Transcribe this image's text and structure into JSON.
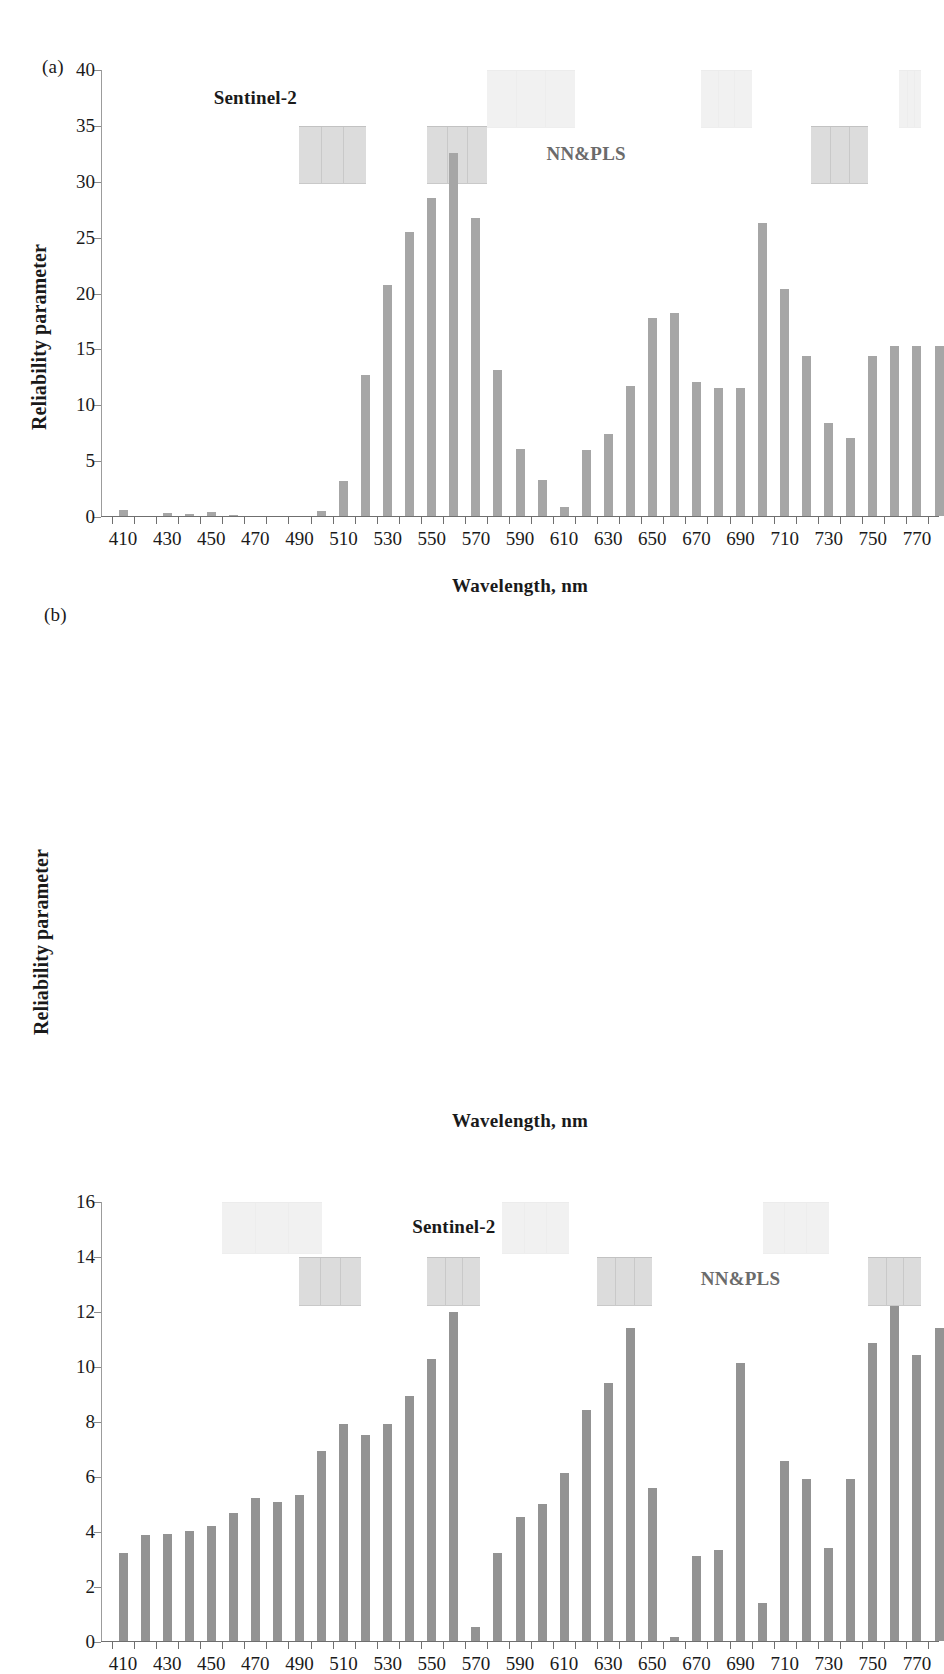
{
  "figure": {
    "panels": [
      {
        "tag": "(a)",
        "xlabel": "Wavelength, nm",
        "ylabel": "Reliability parameter",
        "annotations": [
          {
            "text": "Sentinel-2",
            "style": "dark"
          },
          {
            "text": "NN&PLS",
            "style": "grey"
          }
        ]
      },
      {
        "tag": "(b)",
        "xlabel": "Wavelength, nm",
        "ylabel": "Reliability parameter",
        "annotations": [
          {
            "text": "Sentinel-2",
            "style": "dark"
          },
          {
            "text": "NN&PLS",
            "style": "grey"
          }
        ]
      }
    ]
  },
  "chart_data": [
    {
      "type": "bar",
      "panel": "(a)",
      "title": "",
      "xlabel": "Wavelength, nm",
      "ylabel": "Reliability parameter",
      "ylim": [
        0,
        40
      ],
      "ytick_labels": [
        "0",
        "5",
        "10",
        "15",
        "20",
        "25",
        "30",
        "35",
        "40"
      ],
      "yticks": [
        0,
        5,
        10,
        15,
        20,
        25,
        30,
        35,
        40
      ],
      "xtick_labels": [
        "410",
        "430",
        "450",
        "470",
        "490",
        "510",
        "530",
        "550",
        "570",
        "590",
        "610",
        "630",
        "650",
        "670",
        "690",
        "710",
        "730",
        "750",
        "770"
      ],
      "xticks": [
        410,
        430,
        450,
        470,
        490,
        510,
        530,
        550,
        570,
        590,
        610,
        630,
        650,
        670,
        690,
        710,
        730,
        750,
        770
      ],
      "xlim": [
        400,
        780
      ],
      "grid": false,
      "legend": "none",
      "bar_color": "#a6a6a6",
      "categories": [
        410,
        420,
        430,
        440,
        450,
        460,
        470,
        480,
        490,
        500,
        510,
        520,
        530,
        540,
        550,
        560,
        570,
        580,
        590,
        600,
        610,
        620,
        630,
        640,
        650,
        660,
        670,
        680,
        690,
        700,
        710,
        720,
        730,
        740,
        750,
        760,
        770,
        780
      ],
      "values": [
        0.5,
        0.0,
        0.25,
        0.15,
        0.4,
        0.05,
        0.0,
        0.0,
        0.0,
        0.45,
        3.1,
        12.6,
        20.7,
        25.4,
        28.5,
        32.5,
        26.7,
        13.1,
        6.0,
        3.2,
        0.8,
        5.9,
        7.3,
        11.6,
        17.7,
        18.2,
        12.0,
        11.5,
        11.5,
        26.2,
        20.3,
        14.3,
        8.3,
        7.0,
        14.3,
        15.2,
        15.2,
        15.2
      ],
      "bands": [
        {
          "label": "Sentinel-2 band",
          "x_start": 490,
          "x_end": 520,
          "y_start": 30,
          "y_end": 35,
          "shade": "solid"
        },
        {
          "label": "Sentinel-2 band",
          "x_start": 548,
          "x_end": 575,
          "y_start": 30,
          "y_end": 35,
          "shade": "solid"
        },
        {
          "label": "Sentinel-2 band",
          "x_start": 575,
          "x_end": 615,
          "y_start": 35,
          "y_end": 40,
          "shade": "faint"
        },
        {
          "label": "Sentinel-2 band",
          "x_start": 672,
          "x_end": 695,
          "y_start": 35,
          "y_end": 40,
          "shade": "faint"
        },
        {
          "label": "Sentinel-2 band",
          "x_start": 722,
          "x_end": 748,
          "y_start": 30,
          "y_end": 35,
          "shade": "solid"
        },
        {
          "label": "Sentinel-2 band",
          "x_start": 762,
          "x_end": 772,
          "y_start": 35,
          "y_end": 40,
          "shade": "faint"
        }
      ],
      "annotations": [
        {
          "text": "Sentinel-2",
          "x": 470,
          "y": 37.5
        },
        {
          "text": "NN&PLS",
          "x": 620,
          "y": 32.5
        }
      ]
    },
    {
      "type": "bar",
      "panel": "(b)",
      "title": "",
      "xlabel": "Wavelength, nm",
      "ylabel": "Reliability parameter",
      "ylim": [
        0,
        16
      ],
      "ytick_labels": [
        "0",
        "2",
        "4",
        "6",
        "8",
        "10",
        "12",
        "14",
        "16"
      ],
      "yticks": [
        0,
        2,
        4,
        6,
        8,
        10,
        12,
        14,
        16
      ],
      "xtick_labels": [
        "410",
        "430",
        "450",
        "470",
        "490",
        "510",
        "530",
        "550",
        "570",
        "590",
        "610",
        "630",
        "650",
        "670",
        "690",
        "710",
        "730",
        "750",
        "770"
      ],
      "xticks": [
        410,
        430,
        450,
        470,
        490,
        510,
        530,
        550,
        570,
        590,
        610,
        630,
        650,
        670,
        690,
        710,
        730,
        750,
        770
      ],
      "xlim": [
        400,
        780
      ],
      "grid": false,
      "legend": "none",
      "bar_color": "#939393",
      "categories": [
        410,
        420,
        430,
        440,
        450,
        460,
        470,
        480,
        490,
        500,
        510,
        520,
        530,
        540,
        550,
        560,
        570,
        580,
        590,
        600,
        610,
        620,
        630,
        640,
        650,
        660,
        670,
        680,
        690,
        700,
        710,
        720,
        730,
        740,
        750,
        760,
        770,
        780
      ],
      "values": [
        3.2,
        3.85,
        3.9,
        4.0,
        4.2,
        4.65,
        5.2,
        5.05,
        5.3,
        6.9,
        7.9,
        7.5,
        7.9,
        8.9,
        10.25,
        11.95,
        0.5,
        3.2,
        4.5,
        5.0,
        6.1,
        8.4,
        9.4,
        11.4,
        5.55,
        0.15,
        3.1,
        3.3,
        10.1,
        1.4,
        6.55,
        5.9,
        3.4,
        5.9,
        10.85,
        12.2,
        10.4,
        11.4
      ],
      "bands": [
        {
          "label": "Sentinel-2 band",
          "x_start": 490,
          "x_end": 518,
          "y_start": 12.3,
          "y_end": 14.0,
          "shade": "solid"
        },
        {
          "label": "Sentinel-2 band",
          "x_start": 548,
          "x_end": 572,
          "y_start": 12.3,
          "y_end": 14.0,
          "shade": "solid"
        },
        {
          "label": "Sentinel-2 band",
          "x_start": 625,
          "x_end": 650,
          "y_start": 12.3,
          "y_end": 14.0,
          "shade": "solid"
        },
        {
          "label": "Sentinel-2 band",
          "x_start": 748,
          "x_end": 772,
          "y_start": 12.3,
          "y_end": 14.0,
          "shade": "solid"
        },
        {
          "label": "Sentinel-2 band",
          "x_start": 455,
          "x_end": 500,
          "y_start": 14.2,
          "y_end": 16.0,
          "shade": "faint"
        },
        {
          "label": "Sentinel-2 band",
          "x_start": 582,
          "x_end": 612,
          "y_start": 14.2,
          "y_end": 16.0,
          "shade": "faint"
        },
        {
          "label": "Sentinel-2 band",
          "x_start": 700,
          "x_end": 730,
          "y_start": 14.2,
          "y_end": 16.0,
          "shade": "faint"
        }
      ],
      "annotations": [
        {
          "text": "Sentinel-2",
          "x": 560,
          "y": 15.1
        },
        {
          "text": "NN&PLS",
          "x": 690,
          "y": 13.2
        }
      ]
    }
  ]
}
